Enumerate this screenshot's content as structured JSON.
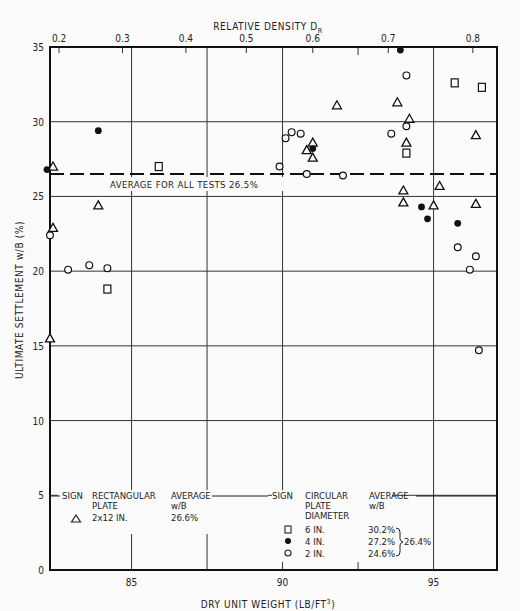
{
  "chart_data": {
    "type": "scatter",
    "title": "",
    "xlabel": "DRY UNIT WEIGHT (LB/FT³)",
    "ylabel": "ULTIMATE SETTLEMENT w/B (%)",
    "top_xlabel": "RELATIVE DENSITY D_R",
    "xlim": [
      82.3,
      97.1
    ],
    "ylim": [
      0,
      35
    ],
    "x_ticks": [
      85,
      90,
      95
    ],
    "y_ticks": [
      0,
      5,
      10,
      15,
      20,
      25,
      30,
      35
    ],
    "top_ticks": [
      {
        "label": "0.2",
        "x": 82.6
      },
      {
        "label": "0.3",
        "x": 84.7
      },
      {
        "label": "0.4",
        "x": 86.8
      },
      {
        "label": "0.5",
        "x": 88.8
      },
      {
        "label": "0.6",
        "x": 91.0
      },
      {
        "label": "0.7",
        "x": 93.5
      },
      {
        "label": "0.8",
        "x": 96.3
      }
    ],
    "grid": true,
    "reference_line": {
      "y": 26.5,
      "style": "dashed",
      "label": "AVERAGE FOR ALL TESTS 26.5%"
    },
    "series": [
      {
        "name": "Rectangular plate 2x12 in.",
        "marker": "triangle",
        "points": [
          [
            82.4,
            27.0
          ],
          [
            82.4,
            22.9
          ],
          [
            83.9,
            24.4
          ],
          [
            82.3,
            15.5
          ],
          [
            91.8,
            31.1
          ],
          [
            91.0,
            28.6
          ],
          [
            90.8,
            28.1
          ],
          [
            91.0,
            27.6
          ],
          [
            93.8,
            31.3
          ],
          [
            94.2,
            30.2
          ],
          [
            94.1,
            28.6
          ],
          [
            94.0,
            25.4
          ],
          [
            95.2,
            25.7
          ],
          [
            94.0,
            24.6
          ],
          [
            95.0,
            24.4
          ],
          [
            96.4,
            24.5
          ],
          [
            96.4,
            29.1
          ]
        ]
      },
      {
        "name": "Circular plate 6 in.",
        "marker": "square",
        "points": [
          [
            85.9,
            27.0
          ],
          [
            84.2,
            18.8
          ],
          [
            95.7,
            32.6
          ],
          [
            96.6,
            32.3
          ],
          [
            94.1,
            27.9
          ]
        ]
      },
      {
        "name": "Circular plate 4 in.",
        "marker": "filled-circle",
        "points": [
          [
            82.2,
            26.8
          ],
          [
            83.9,
            29.4
          ],
          [
            93.9,
            34.8
          ],
          [
            91.0,
            28.2
          ],
          [
            94.6,
            24.3
          ],
          [
            94.8,
            23.5
          ],
          [
            95.8,
            23.2
          ]
        ]
      },
      {
        "name": "Circular plate 2 in.",
        "marker": "open-circle",
        "points": [
          [
            82.3,
            22.4
          ],
          [
            82.9,
            20.1
          ],
          [
            83.6,
            20.4
          ],
          [
            84.2,
            20.2
          ],
          [
            90.1,
            28.9
          ],
          [
            90.3,
            29.3
          ],
          [
            90.6,
            29.2
          ],
          [
            89.9,
            27.0
          ],
          [
            90.8,
            26.5
          ],
          [
            92.0,
            26.4
          ],
          [
            93.6,
            29.2
          ],
          [
            94.1,
            29.7
          ],
          [
            94.1,
            33.1
          ],
          [
            95.8,
            21.6
          ],
          [
            96.4,
            21.0
          ],
          [
            96.2,
            20.1
          ],
          [
            96.5,
            14.7
          ]
        ]
      }
    ],
    "legend": {
      "rectangular": {
        "headers": [
          "SIGN",
          "RECTANGULAR PLATE",
          "AVERAGE w/B"
        ],
        "rows": [
          {
            "sign": "triangle",
            "size": "2x12 IN.",
            "average": "26.6%"
          }
        ]
      },
      "circular": {
        "headers": [
          "SIGN",
          "CIRCULAR PLATE DIAMETER",
          "AVERAGE w/B"
        ],
        "rows": [
          {
            "sign": "square",
            "size": "6 IN.",
            "average": "30.2%"
          },
          {
            "sign": "filled-circle",
            "size": "4 IN.",
            "average": "27.2%"
          },
          {
            "sign": "open-circle",
            "size": "2 IN.",
            "average": "24.6%"
          }
        ],
        "group_average": "26.4%"
      }
    }
  },
  "text": {
    "top_axis_title": "RELATIVE DENSITY D",
    "top_axis_sub": "R",
    "x_axis_title": "DRY UNIT WEIGHT (LB/FT",
    "x_axis_sup": "3",
    "x_axis_close": ")",
    "y_axis_title": "ULTIMATE SETTLEMENT w/B (%)",
    "avg_line_label": "AVERAGE FOR ALL TESTS 26.5%",
    "leg_sign": "SIGN",
    "leg_rect_1": "RECTANGULAR",
    "leg_rect_2": "PLATE",
    "leg_avg_1": "AVERAGE",
    "leg_avg_2": "w/B",
    "leg_rect_size": "2x12 IN.",
    "leg_rect_avg": "26.6%",
    "leg_circ_1": "CIRCULAR",
    "leg_circ_2": "PLATE",
    "leg_circ_3": "DIAMETER",
    "leg_c6": "6 IN.",
    "leg_c4": "4 IN.",
    "leg_c2": "2 IN.",
    "leg_c6_avg": "30.2%",
    "leg_c4_avg": "27.2%",
    "leg_c2_avg": "24.6%",
    "leg_group_avg": "26.4%"
  }
}
